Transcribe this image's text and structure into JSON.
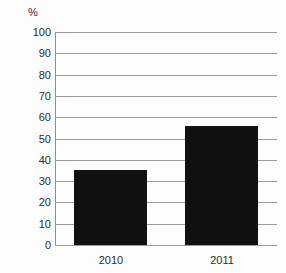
{
  "chart_data": {
    "type": "bar",
    "title": "",
    "subtitle": "",
    "xlabel": "",
    "ylabel": "%",
    "unit_label": "%",
    "categories": [
      "2010",
      "2011"
    ],
    "values": [
      35,
      56
    ],
    "series": [
      {
        "name": "",
        "values": [
          35,
          56
        ]
      }
    ],
    "ylim": [
      0,
      100
    ],
    "y_ticks": [
      0,
      10,
      20,
      30,
      40,
      50,
      60,
      70,
      80,
      90,
      100
    ],
    "y_tick_labels": [
      "0",
      "10",
      "20",
      "30",
      "40",
      "50",
      "60",
      "70",
      "80",
      "90",
      "100"
    ],
    "grid": true,
    "grid_axis": "y",
    "legend": false,
    "legend_position": "none",
    "annotations": [],
    "colors": {
      "bar": "#111111",
      "gridline": "#9a9a9a",
      "axis": "#8f8f8f",
      "text": "#2b2b2b",
      "background": "#fdfdfd"
    }
  }
}
